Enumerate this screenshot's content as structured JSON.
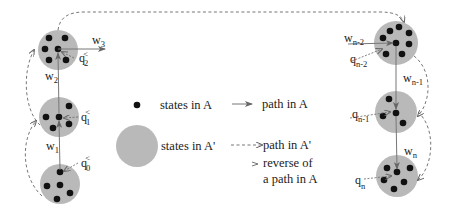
{
  "colors": {
    "region_fill": "#b9b9b9",
    "state_dot": "#111111",
    "path_line": "#777777",
    "dashed_line": "#666666",
    "background": "#ffffff"
  },
  "states": {
    "q0": {
      "base": "q",
      "sub": "0",
      "sup": "<"
    },
    "q1": {
      "base": "q",
      "sub": "1",
      "sup": "<"
    },
    "q2": {
      "base": "q",
      "sub": "2",
      "sup": "<"
    },
    "qn2": {
      "base": "q",
      "sub": "n-2"
    },
    "qn1": {
      "base": "q",
      "sub": "n-1"
    },
    "qn": {
      "base": "q",
      "sub": "n"
    }
  },
  "paths": {
    "w1": {
      "base": "w",
      "sub": "1"
    },
    "w2": {
      "base": "w",
      "sub": "2"
    },
    "w3": {
      "base": "w",
      "sub": "3"
    },
    "wn2": {
      "base": "w",
      "sub": "n-2"
    },
    "wn1": {
      "base": "w",
      "sub": "n-1"
    },
    "wn": {
      "base": "w",
      "sub": "n"
    }
  },
  "legend": {
    "dot_label": "states in  A",
    "circle_label": "states in  A'",
    "solid_arrow_label": "path in  A",
    "dashed_arrow_label": "path in  A'",
    "reverse_label_line1": "reverse of",
    "reverse_label_line2": "a path in  A"
  }
}
